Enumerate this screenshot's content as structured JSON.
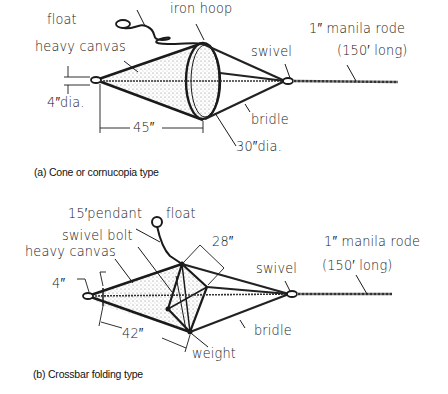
{
  "figure_a": {
    "caption": "(a) Cone or cornucopia type",
    "labels": {
      "float": "float",
      "iron_hoop": "iron hoop",
      "heavy_canvas": "heavy canvas",
      "swivel": "swivel",
      "rode_line1": "1″ manila rode",
      "rode_line2": "(150′ long)",
      "small_dia": "4″dia.",
      "length": "45″",
      "bridle": "bridle",
      "hoop_dia": "30″dia."
    }
  },
  "figure_b": {
    "caption": "(b) Crossbar folding type",
    "labels": {
      "pendant": "15′pendant",
      "float": "float",
      "swivel_bolt": "swivel bolt",
      "heavy_canvas": "heavy canvas",
      "crossbar": "28″",
      "swivel": "swivel",
      "rode_line1": "1″ manila rode",
      "rode_line2": "(150′ long)",
      "small_dia": "4″",
      "length": "42″",
      "bridle": "bridle",
      "weight": "weight"
    }
  }
}
